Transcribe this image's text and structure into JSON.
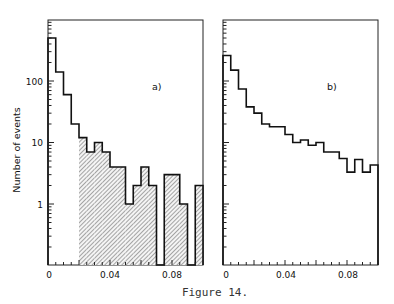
{
  "caption": "Figure 14.",
  "chart_data": [
    {
      "type": "bar",
      "subtype": "histogram",
      "panel_label": "a)",
      "ylabel": "Number of events",
      "xlabel": "",
      "yscale": "log",
      "ylim": [
        0.3,
        1000
      ],
      "xlim": [
        0,
        0.1
      ],
      "bin_width": 0.005,
      "xticks": [
        0,
        0.04,
        0.08
      ],
      "xtick_labels": [
        "0",
        "0.04",
        "0.08"
      ],
      "yticks": [
        1,
        10,
        100
      ],
      "ytick_labels": [
        "1",
        "10",
        "100"
      ],
      "bin_edges": [
        0,
        0.005,
        0.01,
        0.015,
        0.02,
        0.025,
        0.03,
        0.035,
        0.04,
        0.045,
        0.05,
        0.055,
        0.06,
        0.065,
        0.07,
        0.075,
        0.08,
        0.085,
        0.09,
        0.095,
        0.1
      ],
      "values": [
        500,
        140,
        60,
        20,
        12,
        7,
        10,
        7,
        4,
        4,
        1,
        2,
        4,
        2,
        0,
        3,
        3,
        1,
        0,
        2
      ],
      "shaded_from_x": 0.02,
      "grid": false
    },
    {
      "type": "bar",
      "subtype": "histogram",
      "panel_label": "b)",
      "ylabel": "",
      "xlabel": "",
      "yscale": "log",
      "ylim": [
        0.3,
        1000
      ],
      "xlim": [
        0,
        0.1
      ],
      "bin_width": 0.005,
      "xticks": [
        0,
        0.04,
        0.08
      ],
      "xtick_labels": [
        "0",
        "0.04",
        "0.08"
      ],
      "bin_edges": [
        0,
        0.005,
        0.01,
        0.015,
        0.02,
        0.025,
        0.03,
        0.035,
        0.04,
        0.045,
        0.05,
        0.055,
        0.06,
        0.065,
        0.07,
        0.075,
        0.08,
        0.085,
        0.09,
        0.095,
        0.1
      ],
      "values": [
        260,
        150,
        74,
        38,
        30,
        20,
        18,
        18,
        13.5,
        10,
        11,
        9,
        10,
        7,
        7,
        5.5,
        3.3,
        5.3,
        3.3,
        4.3
      ],
      "shaded_from_x": null,
      "grid": false
    }
  ]
}
